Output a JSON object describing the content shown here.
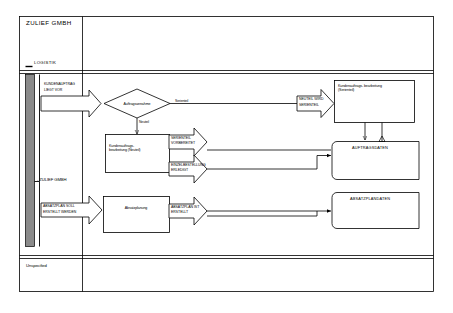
{
  "diagram": {
    "type": "event-driven-process-chain",
    "title": "ZULIEF GMBH",
    "lanes": [
      {
        "id": "lane-logistik",
        "title": "ZULIEF GMBH",
        "sublabel": "LOGISTIK"
      },
      {
        "id": "lane-zulief",
        "label": "- ZULIEF GMBH"
      },
      {
        "id": "lane-unspecified",
        "label": "Unspecified"
      }
    ],
    "events": [
      {
        "id": "ev-kundenauftrag",
        "line1": "KUNDENAUFTRAG",
        "line2": "LIEGT VOR"
      },
      {
        "id": "ev-neuteil-serienteil",
        "line1": "NEUTEIL WIRD",
        "line2": "SERIENTEIL"
      },
      {
        "id": "ev-serienteil-vorbereitet",
        "line1": "SERIENTEIL",
        "line2": "VORBEREITET"
      },
      {
        "id": "ev-einzelbestellung-erledigt",
        "line1": "EINZELBESTELLUNG",
        "line2": "ERLEDIGT"
      },
      {
        "id": "ev-absatzplan-soll",
        "line1": "ABSATZPLAN SOLL",
        "line2": "ERSTELLT WERDEN"
      },
      {
        "id": "ev-absatzplan-ist",
        "line1": "ABSATZPLAN IST",
        "line2": "ERSTELLT"
      }
    ],
    "functions": [
      {
        "id": "fn-kundenauftrag-neuteil",
        "label": "Kundenauftrags-\nbearbeitung (Neuteil)"
      },
      {
        "id": "fn-kundenauftrag-serienteil",
        "label": "Kundenauftrags- bearbeitung\n(Serienteil)"
      },
      {
        "id": "fn-absatzplanung",
        "label": "Absatzplanung"
      }
    ],
    "decisions": [
      {
        "id": "dec-auftragsannahme",
        "label": "Auftragsannahme"
      }
    ],
    "edge_labels": [
      {
        "id": "edge-serienteil",
        "label": "Serienteil"
      },
      {
        "id": "edge-neuteil",
        "label": "Neuteil"
      }
    ],
    "data_stores": [
      {
        "id": "store-auftragsdaten",
        "label": "AUFTRAGSDATEN"
      },
      {
        "id": "store-absatzplandaten",
        "label": "ABSATZPLANDATEN"
      }
    ],
    "colors": {
      "stroke": "#000000",
      "background": "#ffffff",
      "lane_bar": "#8a8a8a",
      "text": "#000000"
    }
  }
}
